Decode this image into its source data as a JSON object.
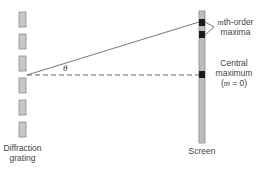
{
  "diagram": {
    "angle_label": "θ",
    "grating": {
      "label_line1": "Diffraction",
      "label_line2": "grating",
      "slit_count": 6
    },
    "screen": {
      "label": "Screen"
    },
    "maxima": {
      "mth_order": {
        "var": "m",
        "label_rest": "th-order",
        "label_line2": "maxima"
      },
      "central": {
        "label_line1": "Central",
        "label_line2": "maximum",
        "paren_open": "(",
        "var": "m",
        "label_eq": " = 0)"
      }
    },
    "colors": {
      "grating_fill": "#c8c8c8",
      "grating_stroke": "#8a8a8a",
      "screen_fill": "#bdbdbd",
      "marker": "#1a1a1a",
      "line": "#555555"
    }
  }
}
